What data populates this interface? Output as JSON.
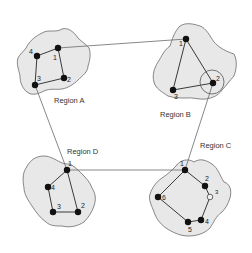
{
  "diagram": {
    "type": "network-regions",
    "regions": [
      {
        "id": "A",
        "label": "Region A",
        "nodes": [
          {
            "id": "1",
            "label": "1",
            "x": 58,
            "y": 48
          },
          {
            "id": "2",
            "label": "2",
            "x": 64,
            "y": 78
          },
          {
            "id": "3",
            "label": "3",
            "x": 35,
            "y": 85
          },
          {
            "id": "4",
            "label": "4",
            "x": 37,
            "y": 56
          }
        ],
        "edges": [
          [
            "1",
            "2"
          ],
          [
            "2",
            "3"
          ],
          [
            "3",
            "4"
          ],
          [
            "4",
            "1"
          ]
        ]
      },
      {
        "id": "B",
        "label": "Region B",
        "nodes": [
          {
            "id": "1",
            "label": "1",
            "x": 186,
            "y": 39
          },
          {
            "id": "2",
            "label": "2",
            "x": 213,
            "y": 83,
            "highlighted": true
          },
          {
            "id": "3",
            "label": "3",
            "x": 173,
            "y": 90
          }
        ],
        "edges": [
          [
            "1",
            "2"
          ],
          [
            "2",
            "3"
          ],
          [
            "3",
            "1"
          ]
        ]
      },
      {
        "id": "C",
        "label": "Region C",
        "nodes": [
          {
            "id": "1",
            "label": "1",
            "x": 185,
            "y": 170
          },
          {
            "id": "2",
            "label": "2",
            "x": 205,
            "y": 186
          },
          {
            "id": "3",
            "label": "3",
            "x": 210,
            "y": 197,
            "hollow": true
          },
          {
            "id": "4",
            "label": "4",
            "x": 201,
            "y": 220
          },
          {
            "id": "5",
            "label": "5",
            "x": 188,
            "y": 222
          },
          {
            "id": "6",
            "label": "6",
            "x": 158,
            "y": 197
          }
        ],
        "edges": [
          [
            "1",
            "2"
          ],
          [
            "2",
            "3"
          ],
          [
            "3",
            "4"
          ],
          [
            "4",
            "5"
          ],
          [
            "5",
            "6"
          ],
          [
            "6",
            "1"
          ]
        ]
      },
      {
        "id": "D",
        "label": "Region D",
        "nodes": [
          {
            "id": "1",
            "label": "1",
            "x": 67,
            "y": 170
          },
          {
            "id": "2",
            "label": "2",
            "x": 78,
            "y": 212
          },
          {
            "id": "3",
            "label": "3",
            "x": 53,
            "y": 212
          },
          {
            "id": "4",
            "label": "4",
            "x": 48,
            "y": 187
          }
        ],
        "edges": [
          [
            "1",
            "2"
          ],
          [
            "2",
            "3"
          ],
          [
            "3",
            "4"
          ],
          [
            "4",
            "1"
          ]
        ]
      }
    ],
    "inter_region_links": [
      {
        "from": "A.1",
        "to": "B.1"
      },
      {
        "from": "B.2",
        "to": "C.1"
      },
      {
        "from": "C.1",
        "to": "D.1"
      },
      {
        "from": "D.1",
        "to": "A.3"
      }
    ]
  }
}
